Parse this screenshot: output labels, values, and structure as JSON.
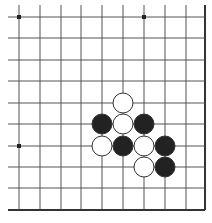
{
  "board": {
    "description": "Go board corner fragment (lower-right corner)",
    "columns_x": [
      19,
      40,
      61,
      81,
      102,
      123,
      144,
      165,
      186,
      205
    ],
    "rows_y": [
      17,
      38,
      60,
      81,
      103,
      124,
      146,
      167,
      188,
      210
    ],
    "line_start_x": 8,
    "line_start_y": 5,
    "edge_right": true,
    "edge_bottom": true,
    "line_color": "#555555",
    "edge_color": "#333333",
    "stone_radius": 10,
    "star_points": [
      {
        "col": 0,
        "row": 0
      },
      {
        "col": 6,
        "row": 0
      },
      {
        "col": 0,
        "row": 6
      }
    ],
    "stones": [
      {
        "color": "white",
        "col": 5,
        "row": 4
      },
      {
        "color": "black",
        "col": 4,
        "row": 5
      },
      {
        "color": "white",
        "col": 5,
        "row": 5
      },
      {
        "color": "black",
        "col": 6,
        "row": 5
      },
      {
        "color": "white",
        "col": 4,
        "row": 6
      },
      {
        "color": "black",
        "col": 5,
        "row": 6
      },
      {
        "color": "white",
        "col": 6,
        "row": 6
      },
      {
        "color": "black",
        "col": 7,
        "row": 6
      },
      {
        "color": "white",
        "col": 6,
        "row": 7
      },
      {
        "color": "black",
        "col": 7,
        "row": 7
      }
    ],
    "colors": {
      "black_stone": "#222222",
      "white_stone": "#ffffff",
      "stone_outline": "#333333"
    }
  }
}
